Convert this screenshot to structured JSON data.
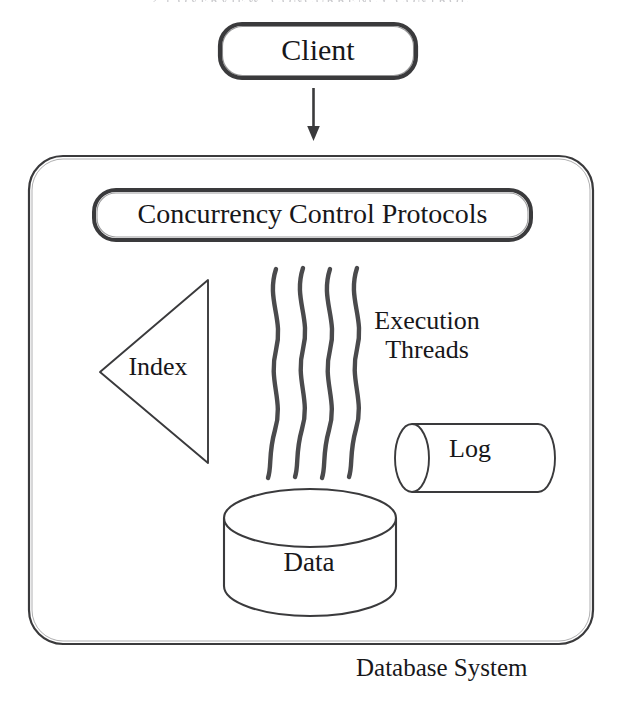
{
  "page": {
    "running_header": "2.1  OVERVIEW: CONCURRENCY CONTROL",
    "background_color": "#ffffff",
    "ink_color": "#3a3a3c",
    "text_color": "#17171a"
  },
  "diagram": {
    "caption": "Database System",
    "client": {
      "label": "Client",
      "shape": "rounded-rectangle"
    },
    "flow_arrow": {
      "name": "client-to-system-arrow",
      "direction": "down"
    },
    "system_box": {
      "shape": "rounded-rectangle",
      "label": "Database System"
    },
    "components": [
      {
        "id": "concurrency-control-protocols",
        "label": "Concurrency Control Protocols",
        "shape": "rounded-rectangle"
      },
      {
        "id": "index",
        "label": "Index",
        "shape": "triangle-left"
      },
      {
        "id": "execution-threads",
        "label": "Execution Threads",
        "label_line_1": "Execution",
        "label_line_2": "Threads",
        "shape": "wavy-lines",
        "count": 4
      },
      {
        "id": "log",
        "label": "Log",
        "shape": "cylinder-horizontal"
      },
      {
        "id": "data",
        "label": "Data",
        "shape": "cylinder-vertical"
      }
    ]
  }
}
